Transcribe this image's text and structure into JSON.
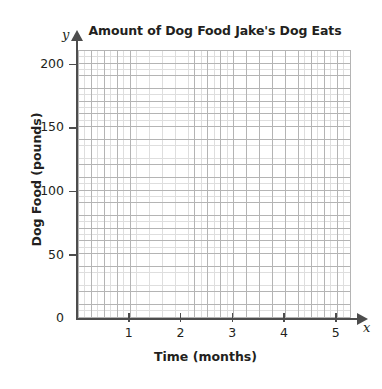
{
  "chart_data": {
    "type": "line",
    "title": "Amount of Dog Food Jake's Dog Eats",
    "xlabel": "Time (months)",
    "ylabel": "Dog Food (pounds)",
    "x_axis_symbol": "x",
    "y_axis_symbol": "y",
    "xlim": [
      0,
      5.4
    ],
    "ylim": [
      0,
      210
    ],
    "x_ticks": [
      {
        "value": 1,
        "label": "1"
      },
      {
        "value": 2,
        "label": "2"
      },
      {
        "value": 3,
        "label": "3"
      },
      {
        "value": 4,
        "label": "4"
      },
      {
        "value": 5,
        "label": "5"
      }
    ],
    "y_ticks": [
      {
        "value": 0,
        "label": "0"
      },
      {
        "value": 50,
        "label": "50"
      },
      {
        "value": 100,
        "label": "100"
      },
      {
        "value": 150,
        "label": "150"
      },
      {
        "value": 200,
        "label": "200"
      }
    ],
    "x_minor_step": 0.125,
    "y_minor_step": 5,
    "x_major_step": 0.25,
    "y_major_step": 10,
    "grid": true,
    "legend": null,
    "series": [],
    "values": [],
    "categories": [],
    "annotations": [],
    "note": "Empty coordinate grid: no data plotted",
    "colors": {
      "background": "#ffffff",
      "grid_major": "#b4b4b4",
      "grid_minor": "#dedede",
      "axis": "#4d4d4d",
      "text": "#231f20"
    }
  }
}
